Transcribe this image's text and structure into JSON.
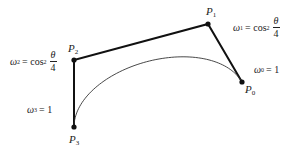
{
  "diagram": {
    "type": "rational-cubic-bezier",
    "control_points": [
      {
        "id": "P0",
        "name": "P",
        "sub": "0",
        "weight_label": {
          "omega": "ω",
          "sub": "0",
          "eq": "= 1"
        }
      },
      {
        "id": "P1",
        "name": "P",
        "sub": "1",
        "weight_label": {
          "omega": "ω",
          "sub": "1",
          "eq": "= cos",
          "sup": "2",
          "num": "θ",
          "den": "4"
        }
      },
      {
        "id": "P2",
        "name": "P",
        "sub": "2",
        "weight_label": {
          "omega": "ω",
          "sub": "2",
          "eq": "= cos",
          "sup": "2",
          "num": "θ",
          "den": "4"
        }
      },
      {
        "id": "P3",
        "name": "P",
        "sub": "3",
        "weight_label": {
          "omega": "ω",
          "sub": "3",
          "eq": "= 1"
        }
      }
    ],
    "colors": {
      "polygon": "#111111",
      "curve": "#333333",
      "point": "#111111"
    }
  }
}
